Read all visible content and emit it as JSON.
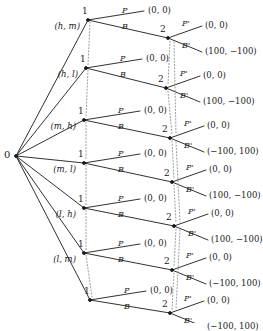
{
  "diagram": {
    "root": {
      "label": "0",
      "name": "chance-node"
    },
    "player1_label": "1",
    "player2_label": "2",
    "colors": {
      "line": "#1a1a1a",
      "info_set": "#888888",
      "background": "#ffffff"
    },
    "actions": {
      "p": "P",
      "b": "B",
      "p_prime": "P'",
      "b_prime": "B'"
    },
    "branches": [
      {
        "type_label": "(h, m)",
        "p_payoff": "(0, 0)",
        "p_prime_payoff": "(0, 0)",
        "b_prime_payoff": "(100, −100)"
      },
      {
        "type_label": "(h, l)",
        "p_payoff": "(0, 0)",
        "p_prime_payoff": "(0, 0)",
        "b_prime_payoff": "(100, −100)"
      },
      {
        "type_label": "(m, h)",
        "p_payoff": "(0, 0)",
        "p_prime_payoff": "(0, 0)",
        "b_prime_payoff": "(−100, 100)"
      },
      {
        "type_label": "(m, l)",
        "p_payoff": "(0, 0)",
        "p_prime_payoff": "(0, 0)",
        "b_prime_payoff": "(100, −100)"
      },
      {
        "type_label": "(l, h)",
        "p_payoff": "(0, 0)",
        "p_prime_payoff": "(0, 0)",
        "b_prime_payoff": "(100, −100)"
      },
      {
        "type_label": "(l, m)",
        "p_payoff": "(0, 0)",
        "p_prime_payoff": "(0, 0)",
        "b_prime_payoff": "(−100, 100)"
      },
      {
        "type_label": "",
        "p_payoff": "(0, 0)",
        "p_prime_payoff": "(0, 0)",
        "b_prime_payoff": "(−100, 100)"
      }
    ]
  }
}
